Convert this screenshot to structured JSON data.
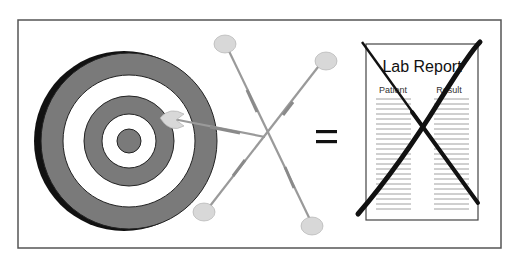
{
  "figure": {
    "equals_symbol": "=",
    "lab_report": {
      "title": "Lab Report",
      "columns": [
        "Patient",
        "Result"
      ],
      "crossed_out": true
    },
    "colors": {
      "frame": "#555555",
      "target_dark": "#7a7a7a",
      "target_shadow": "#111111",
      "target_light": "#ffffff",
      "dart_flight": "#d8d8d8",
      "dart_shaft": "#9a9a9a",
      "cross": "#111111",
      "paper_line": "#888888"
    }
  }
}
